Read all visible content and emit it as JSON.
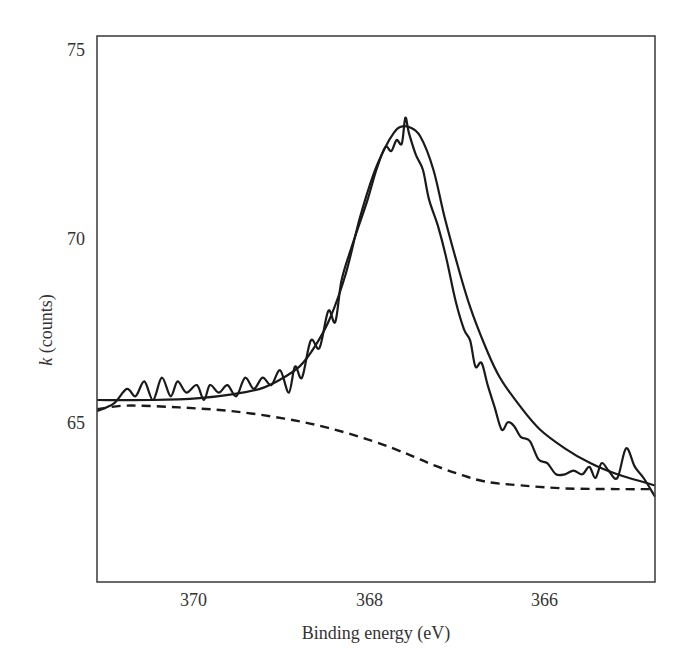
{
  "chart_data": {
    "type": "line",
    "title": "",
    "xlabel": "Binding energy (eV)",
    "ylabel_italic": "k",
    "ylabel_rest": " (counts)",
    "ylabel": "k (counts)",
    "xlim": [
      371.14,
      364.77
    ],
    "ylim": [
      60.7,
      75.4
    ],
    "x_inverted": true,
    "grid": false,
    "legend": null,
    "xticks": [
      370,
      368,
      366
    ],
    "yticks": [
      75,
      70,
      65
    ],
    "series": [
      {
        "name": "measured",
        "style": "solid-noisy",
        "x": [
          371.14,
          370.95,
          370.8,
          370.7,
          370.6,
          370.5,
          370.4,
          370.3,
          370.22,
          370.12,
          370.0,
          369.92,
          369.85,
          369.75,
          369.65,
          369.55,
          369.45,
          369.35,
          369.25,
          369.15,
          369.05,
          368.95,
          368.88,
          368.8,
          368.7,
          368.6,
          368.5,
          368.42,
          368.35,
          368.25,
          368.15,
          368.05,
          367.95,
          367.85,
          367.78,
          367.72,
          367.66,
          367.62,
          367.58,
          367.5,
          367.42,
          367.35,
          367.25,
          367.15,
          367.05,
          366.95,
          366.88,
          366.82,
          366.75,
          366.68,
          366.6,
          366.52,
          366.45,
          366.38,
          366.3,
          366.2,
          366.1,
          366.0,
          365.9,
          365.8,
          365.7,
          365.6,
          365.52,
          365.45,
          365.38,
          365.3,
          365.2,
          365.1,
          365.0,
          364.9,
          364.77
        ],
        "y": [
          65.3,
          65.5,
          65.9,
          65.7,
          66.1,
          65.6,
          66.2,
          65.7,
          66.1,
          65.8,
          66.0,
          65.6,
          66.0,
          65.8,
          66.0,
          65.7,
          66.2,
          65.9,
          66.2,
          66.0,
          66.4,
          65.8,
          66.5,
          66.2,
          67.2,
          67.0,
          68.0,
          67.7,
          68.8,
          69.6,
          70.3,
          71.0,
          71.8,
          72.4,
          72.3,
          72.6,
          72.5,
          73.2,
          72.8,
          72.2,
          71.8,
          71.0,
          70.3,
          69.4,
          68.3,
          67.5,
          67.2,
          66.5,
          66.6,
          66.0,
          65.4,
          64.8,
          65.0,
          64.9,
          64.6,
          64.5,
          64.0,
          63.9,
          63.6,
          63.6,
          63.7,
          63.6,
          63.8,
          63.5,
          63.9,
          63.7,
          63.5,
          64.3,
          63.8,
          63.5,
          63.0
        ]
      },
      {
        "name": "fit",
        "style": "solid-smooth",
        "x": [
          371.14,
          370.5,
          369.97,
          369.6,
          369.28,
          369.05,
          368.83,
          368.65,
          368.48,
          368.3,
          368.14,
          367.98,
          367.85,
          367.75,
          367.68,
          367.58,
          367.45,
          367.3,
          367.17,
          367.02,
          366.88,
          366.7,
          366.54,
          366.3,
          366.08,
          365.8,
          365.51,
          365.2,
          364.77
        ],
        "y": [
          65.6,
          65.6,
          65.65,
          65.75,
          65.9,
          66.15,
          66.5,
          67.05,
          67.8,
          69.0,
          70.5,
          71.7,
          72.4,
          72.8,
          72.95,
          72.95,
          72.7,
          71.8,
          70.5,
          69.2,
          68.1,
          67.0,
          66.2,
          65.4,
          64.8,
          64.3,
          63.9,
          63.6,
          63.3
        ]
      },
      {
        "name": "background",
        "style": "dashed",
        "x": [
          371.14,
          370.8,
          370.2,
          369.6,
          369.0,
          368.5,
          368.0,
          367.6,
          367.3,
          367.0,
          366.7,
          366.3,
          365.8,
          365.2,
          364.77
        ],
        "y": [
          65.35,
          65.45,
          65.4,
          65.3,
          65.1,
          64.85,
          64.5,
          64.15,
          63.85,
          63.6,
          63.4,
          63.3,
          63.22,
          63.2,
          63.2
        ]
      }
    ]
  },
  "axes": {
    "xtick_labels": [
      "370",
      "368",
      "366"
    ],
    "ytick_labels": [
      "75",
      "70",
      "65"
    ]
  }
}
